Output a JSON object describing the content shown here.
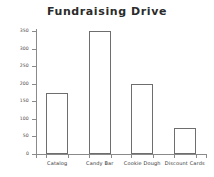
{
  "chart_data": {
    "type": "bar",
    "title": "Fundraising Drive",
    "xlabel": "",
    "ylabel": "",
    "categories": [
      "Catalog",
      "Candy Bar",
      "Cookie Dough",
      "Discount Cards"
    ],
    "values": [
      175,
      350,
      200,
      75
    ],
    "ylim": [
      0,
      350
    ],
    "ytick_labels": [
      "0",
      "50",
      "100",
      "150",
      "200",
      "250",
      "300",
      "350"
    ],
    "ytick_values": [
      0,
      50,
      100,
      150,
      200,
      250,
      300,
      350
    ],
    "grid": false,
    "legend": false,
    "bar_style": {
      "fill": "#ffffff",
      "edge": "#6e6e6e"
    },
    "axis_color": "#8a8a8a",
    "background": "#ffffff",
    "title_color": "#2b2b2b"
  }
}
